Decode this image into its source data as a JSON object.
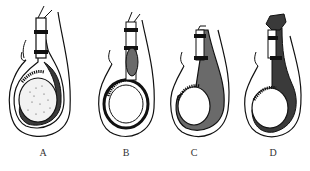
{
  "figures": [
    {
      "id": "A",
      "label": "A",
      "label_x": 33
    },
    {
      "id": "B",
      "label": "B",
      "label_x": 116
    },
    {
      "id": "C",
      "label": "C",
      "label_x": 184
    },
    {
      "id": "D",
      "label": "D",
      "label_x": 263
    }
  ],
  "colors": {
    "ink": "#111111",
    "fluid_fill": "#6a6a6a",
    "background": "#ffffff"
  }
}
